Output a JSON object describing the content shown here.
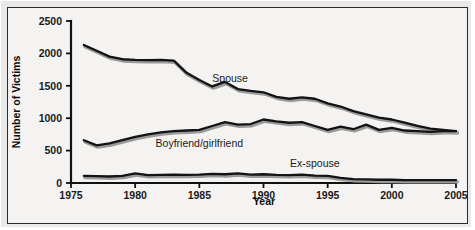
{
  "chart_data": {
    "type": "line",
    "title": "",
    "xlabel": "Year",
    "ylabel": "Number of Victims",
    "xlim": [
      1975,
      2005
    ],
    "ylim": [
      0,
      2500
    ],
    "xticks": [
      1975,
      1980,
      1985,
      1990,
      1995,
      2000,
      2005
    ],
    "xtick_labels": [
      "1975",
      "1980",
      "1985",
      "1990",
      "1995",
      "2000",
      "2005"
    ],
    "yticks": [
      0,
      500,
      1000,
      1500,
      2000,
      2500
    ],
    "ytick_labels": [
      "0",
      "500",
      "1000",
      "1500",
      "2000",
      "2500"
    ],
    "grid": false,
    "legend_position": "inline-annotations",
    "x": [
      1976,
      1977,
      1978,
      1979,
      1980,
      1981,
      1982,
      1983,
      1984,
      1985,
      1986,
      1987,
      1988,
      1989,
      1990,
      1991,
      1992,
      1993,
      1994,
      1995,
      1996,
      1997,
      1998,
      1999,
      2000,
      2001,
      2002,
      2003,
      2004,
      2005
    ],
    "series": [
      {
        "name": "Spouse",
        "color": "#131313",
        "label_x": 1987.4,
        "label_y": 1560,
        "values": [
          2130,
          2040,
          1950,
          1910,
          1900,
          1895,
          1900,
          1890,
          1700,
          1590,
          1490,
          1560,
          1450,
          1420,
          1400,
          1330,
          1300,
          1320,
          1300,
          1230,
          1180,
          1110,
          1060,
          1010,
          980,
          930,
          880,
          840,
          820,
          800
        ]
      },
      {
        "name": "Boyfriend/girlfriend",
        "color": "#131313",
        "label_x": 1985.0,
        "label_y": 560,
        "values": [
          660,
          580,
          610,
          660,
          710,
          750,
          780,
          800,
          810,
          820,
          880,
          940,
          900,
          910,
          980,
          950,
          930,
          940,
          880,
          820,
          870,
          830,
          900,
          820,
          850,
          810,
          800,
          790,
          800,
          800
        ]
      },
      {
        "name": "Ex-spouse",
        "color": "#131313",
        "label_x": 1994.0,
        "label_y": 250,
        "values": [
          110,
          105,
          100,
          110,
          150,
          120,
          125,
          130,
          125,
          130,
          140,
          135,
          150,
          130,
          135,
          125,
          120,
          130,
          115,
          110,
          80,
          60,
          55,
          50,
          50,
          45,
          45,
          45,
          45,
          45
        ]
      }
    ]
  }
}
